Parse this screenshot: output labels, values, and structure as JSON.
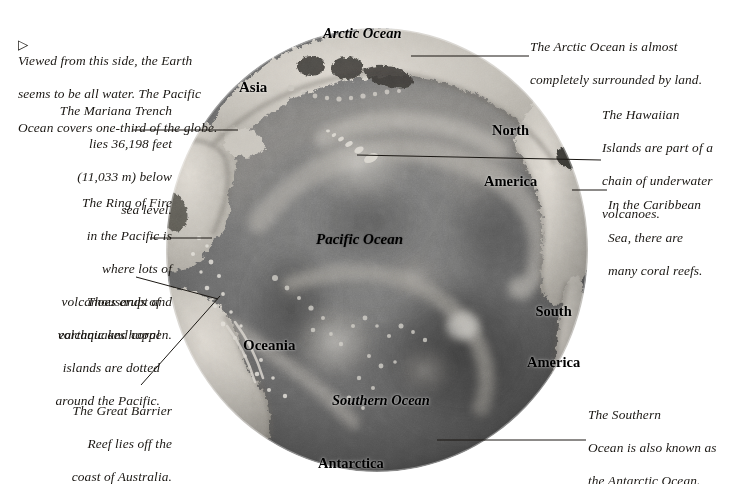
{
  "page": {
    "background_color": "#ffffff",
    "text_color": "#1a1713"
  },
  "bullet": {
    "glyph": "▷",
    "name": "triangle-bullet"
  },
  "notes": {
    "intro": {
      "line1": "Viewed from this side, the Earth",
      "line2": "seems to be all water. The Pacific",
      "line3": "Ocean covers one-third of the globe."
    },
    "mariana": {
      "line1": "The Mariana Trench",
      "line2": "lies 36,198 feet",
      "line3": "(11,033 m) below",
      "line4": "sea level."
    },
    "ring_of_fire": {
      "line1": "The Ring of Fire",
      "line2": "in the Pacific is",
      "line3": "where lots of",
      "line4": "volcanoes erupt and",
      "line5": "earthquakes happen."
    },
    "islands": {
      "line1": "Thousands of",
      "line2": "volcanic and coral",
      "line3": "islands are dotted",
      "line4": "around the Pacific."
    },
    "great_barrier_reef": {
      "line1": "The Great Barrier",
      "line2": "Reef lies off the",
      "line3": "coast of Australia."
    },
    "arctic": {
      "line1": "The Arctic Ocean is almost",
      "line2": "completely surrounded by land."
    },
    "hawaii": {
      "line1": "The Hawaiian",
      "line2": "Islands are part of a",
      "line3": "chain of underwater",
      "line4": "volcanoes."
    },
    "caribbean": {
      "line1": "In the Caribbean",
      "line2": "Sea, there are",
      "line3": "many coral reefs."
    },
    "southern": {
      "line1": "The Southern",
      "line2": "Ocean is also known as",
      "line3": "the Antarctic Ocean."
    }
  },
  "map_labels": {
    "arctic_ocean": "Arctic Ocean",
    "asia": "Asia",
    "north_america_1": "North",
    "north_america_2": "America",
    "pacific_ocean": "Pacific Ocean",
    "south_america_1": "South",
    "south_america_2": "America",
    "oceania": "Oceania",
    "southern_ocean": "Southern Ocean",
    "antarctica": "Antarctica"
  },
  "globe": {
    "center_x": 377,
    "center_y": 250,
    "radius": 211,
    "ocean_color": "#6f6f6f",
    "deep_color": "#3d3d3d",
    "land_color": "#cfcbc4",
    "shelf_color": "#9a968f",
    "highlight_color": "#e8e5df"
  },
  "leader_lines": [
    {
      "name": "mariana-leader",
      "x1": 132,
      "y1": 130,
      "x2": 238,
      "y2": 130
    },
    {
      "name": "ringfire-leader",
      "x1": 150,
      "y1": 238,
      "x2": 210,
      "y2": 238
    },
    {
      "name": "islands-leader",
      "x1": 136,
      "y1": 277,
      "x2": 216,
      "y2": 300
    },
    {
      "name": "gbr-leader",
      "x1": 140,
      "y1": 386,
      "x2": 218,
      "y2": 296
    },
    {
      "name": "arctic-leader",
      "x1": 529,
      "y1": 56,
      "x2": 412,
      "y2": 56
    },
    {
      "name": "hawaii-leader",
      "x1": 601,
      "y1": 160,
      "x2": 357,
      "y2": 155
    },
    {
      "name": "caribbean-leader",
      "x1": 607,
      "y1": 190,
      "x2": 570,
      "y2": 190
    },
    {
      "name": "southern-leader",
      "x1": 587,
      "y1": 440,
      "x2": 436,
      "y2": 440
    }
  ]
}
